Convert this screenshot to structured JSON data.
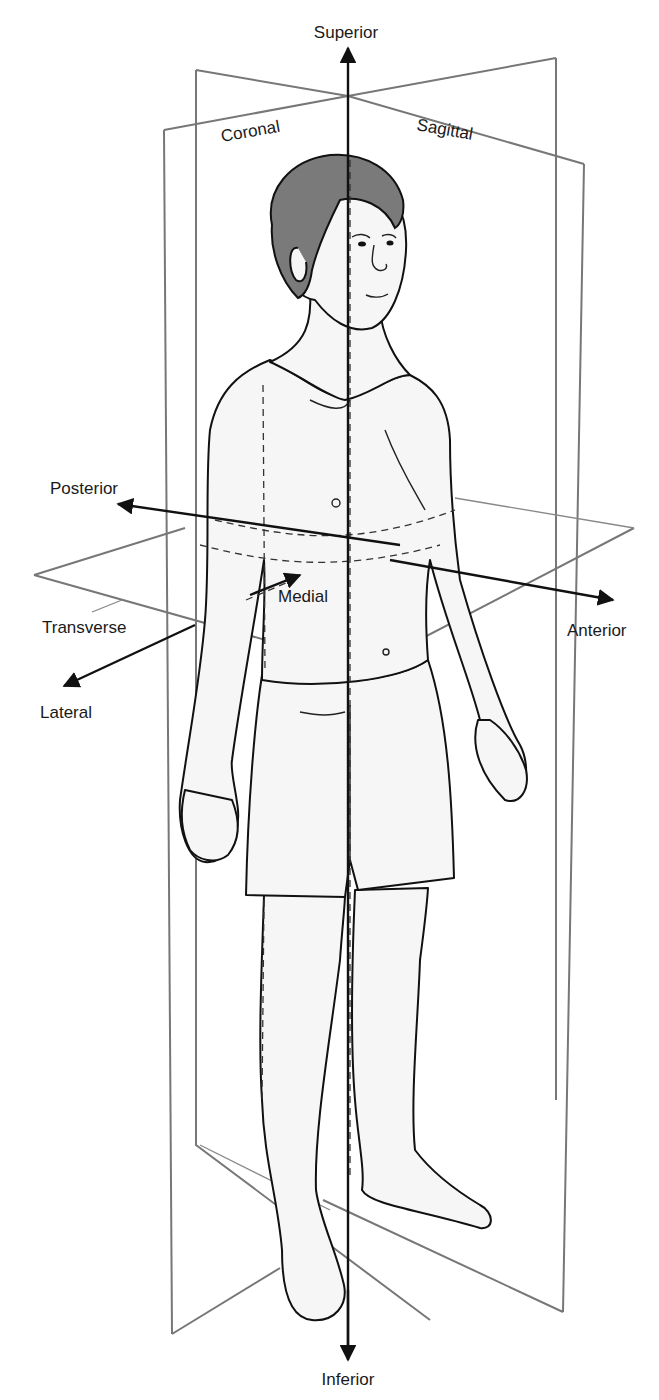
{
  "diagram": {
    "axes": {
      "superior": "Superior",
      "inferior": "Inferior",
      "posterior": "Posterior",
      "anterior": "Anterior",
      "medial": "Medial",
      "lateral": "Lateral"
    },
    "planes": {
      "coronal": "Coronal",
      "sagittal": "Sagittal",
      "transverse": "Transverse"
    },
    "colors": {
      "plane_stroke": "#777777",
      "axis_stroke": "#111111",
      "hair_fill": "#7a7a7a",
      "skin_fill": "#f6f6f6"
    }
  }
}
